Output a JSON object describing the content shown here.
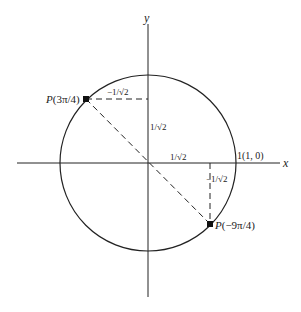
{
  "diagram": {
    "axes": {
      "x_label": "x",
      "y_label": "y"
    },
    "circle": {
      "description": "unit circle",
      "intercept_label": "1(1, 0)"
    },
    "points": [
      {
        "name": "P(3π/4)",
        "label_prefix": "P",
        "label_arg": "(3π/4)",
        "x_value": "−1/√2",
        "y_value": "1/√2"
      },
      {
        "name": "P(−9π/4)",
        "label_prefix": "P",
        "label_arg": "(−9π/4)",
        "x_value": "1/√2",
        "y_value": "−1/√2"
      }
    ],
    "segment_labels": {
      "top_horizontal": "−1/√2",
      "left_vertical": "1/√2",
      "bottom_horizontal": "1/√2",
      "right_vertical": "−1/√2"
    },
    "colors": {
      "stroke": "#222222",
      "background": "#ffffff"
    }
  }
}
